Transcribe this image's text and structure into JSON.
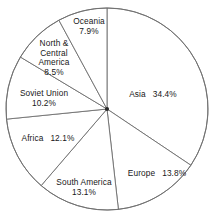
{
  "chart_data": {
    "type": "pie",
    "title": "",
    "subtitle": "",
    "xlabel": "",
    "ylabel": "",
    "legend_position": "none",
    "grid": false,
    "start_angle_deg": 0,
    "direction": "clockwise",
    "value_unit": "%",
    "categories": [
      "Asia",
      "Europe",
      "South America",
      "Africa",
      "Soviet Union",
      "North & Central America",
      "Oceania"
    ],
    "values": [
      34.4,
      13.8,
      13.1,
      12.1,
      10.2,
      8.5,
      7.9
    ],
    "labels": [
      "Asia   34.4%",
      "Europe   13.8%",
      "South America 13.1%",
      "Africa   12.1%",
      "Soviet Union 10.2%",
      "North & Central America 8.5%",
      "Oceania 7.9%"
    ],
    "slices": [
      {
        "name": "Asia",
        "value": 34.4,
        "value_text": "34.4%",
        "label_lines": [
          "Asia"
        ],
        "layout": "inline-gap",
        "label_x": 153,
        "label_y": 95,
        "fill": "#ffffff"
      },
      {
        "name": "Europe",
        "value": 13.8,
        "value_text": "13.8%",
        "label_lines": [
          "Europe"
        ],
        "layout": "inline-gap",
        "label_x": 157,
        "label_y": 174,
        "fill": "#ffffff"
      },
      {
        "name": "South America",
        "value": 13.1,
        "value_text": "13.1%",
        "label_lines": [
          "South America"
        ],
        "layout": "stacked",
        "label_x": 84,
        "label_y": 188,
        "fill": "#ffffff"
      },
      {
        "name": "Africa",
        "value": 12.1,
        "value_text": "12.1%",
        "label_lines": [
          "Africa"
        ],
        "layout": "inline-gap",
        "label_x": 48,
        "label_y": 139,
        "fill": "#ffffff"
      },
      {
        "name": "Soviet Union",
        "value": 10.2,
        "value_text": "10.2%",
        "label_lines": [
          "Soviet Union"
        ],
        "layout": "stacked",
        "label_x": 44,
        "label_y": 99,
        "fill": "#ffffff"
      },
      {
        "name": "North & Central America",
        "value": 8.5,
        "value_text": "8.5%",
        "label_lines": [
          "North &",
          "Central",
          "America"
        ],
        "layout": "stacked",
        "label_x": 54,
        "label_y": 58,
        "fill": "#ffffff"
      },
      {
        "name": "Oceania",
        "value": 7.9,
        "value_text": "7.9%",
        "label_lines": [
          "Oceania"
        ],
        "layout": "stacked",
        "label_x": 89,
        "label_y": 27,
        "fill": "#ffffff"
      }
    ],
    "total": 100.0,
    "geometry": {
      "center_x": 107,
      "center_y": 109,
      "radius": 101,
      "stroke_color": "#6e6e6e",
      "background": "#ffffff"
    }
  }
}
